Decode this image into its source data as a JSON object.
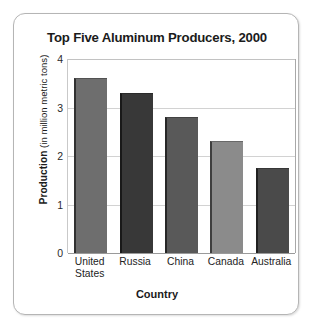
{
  "chart_data": {
    "type": "bar",
    "title": "Top Five Aluminum Producers, 2000",
    "xlabel": "Country",
    "ylabel": "Production (in million metric tons)",
    "ylabel_bold_part": "Production",
    "ylabel_regular_part": " (in million metric tons)",
    "categories": [
      "United States",
      "Russia",
      "China",
      "Canada",
      "Australia"
    ],
    "category_lines": [
      [
        "United",
        "States"
      ],
      [
        "Russia"
      ],
      [
        "China"
      ],
      [
        "Canada"
      ],
      [
        "Australia"
      ]
    ],
    "values": [
      3.6,
      3.3,
      2.8,
      2.3,
      1.75
    ],
    "units": "million metric tons",
    "ylim": [
      0,
      4
    ],
    "yticks": [
      4,
      3,
      2,
      1,
      0
    ],
    "ytick_labels": [
      "4",
      "3",
      "2",
      "1",
      "0"
    ],
    "grid": true,
    "legend": "none",
    "bar_colors": [
      "#6e6e6e",
      "#383838",
      "#595959",
      "#8b8b8b",
      "#4a4a4a"
    ],
    "series": [
      {
        "name": "Production",
        "points": [
          {
            "category": "United States",
            "value": 3.6,
            "color": "#6e6e6e"
          },
          {
            "category": "Russia",
            "value": 3.3,
            "color": "#383838"
          },
          {
            "category": "China",
            "value": 2.8,
            "color": "#595959"
          },
          {
            "category": "Canada",
            "value": 2.3,
            "color": "#8b8b8b"
          },
          {
            "category": "Australia",
            "value": 1.75,
            "color": "#4a4a4a"
          }
        ]
      }
    ]
  },
  "frame": {
    "border_color": "#b5b5b5",
    "background": "#ffffff"
  }
}
